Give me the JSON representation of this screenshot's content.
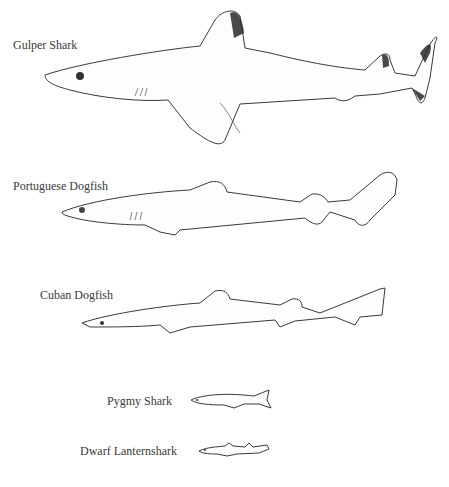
{
  "figure": {
    "type": "species-size-comparison",
    "background": "#ffffff",
    "species": [
      {
        "label": "Gulper Shark"
      },
      {
        "label": "Portuguese Dogfish"
      },
      {
        "label": "Cuban Dogfish"
      },
      {
        "label": "Pygmy Shark"
      },
      {
        "label": "Dwarf Lanternshark"
      }
    ]
  }
}
